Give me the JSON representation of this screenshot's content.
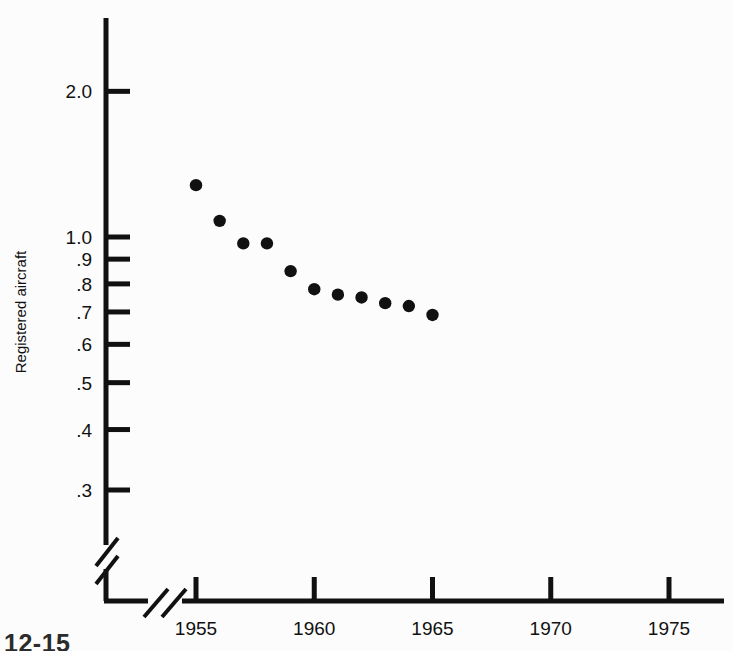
{
  "figure": {
    "caption_fragment": "12-15",
    "background_color": "#fcfcfc",
    "ink_color": "#111111"
  },
  "chart_data": {
    "type": "scatter",
    "title": "",
    "subtitle": "",
    "xlabel": "",
    "ylabel": "Registered aircraft",
    "x": [
      1955,
      1956,
      1957,
      1958,
      1959,
      1960,
      1961,
      1962,
      1963,
      1964,
      1965
    ],
    "values": [
      1.28,
      1.08,
      0.97,
      0.97,
      0.85,
      0.78,
      0.76,
      0.75,
      0.73,
      0.72,
      0.69
    ],
    "series": [
      {
        "name": "Registered aircraft",
        "values": [
          1.28,
          1.08,
          0.97,
          0.97,
          0.85,
          0.78,
          0.76,
          0.75,
          0.73,
          0.72,
          0.69
        ]
      }
    ],
    "xlim": [
      1953,
      1977
    ],
    "ylim": [
      0.28,
      2.3
    ],
    "yscale": "log",
    "xscale": "linear",
    "grid": false,
    "legend": false,
    "legend_position": "none",
    "marker": "filled-circle",
    "marker_color": "#111111",
    "x_ticks": [
      1955,
      1960,
      1965,
      1970,
      1975
    ],
    "x_tick_labels": [
      "1955",
      "1960",
      "1965",
      "1970",
      "1975"
    ],
    "y_ticks": [
      0.3,
      0.4,
      0.5,
      0.6,
      0.7,
      0.8,
      0.9,
      1.0,
      2.0
    ],
    "y_tick_labels": [
      ".3",
      ".4",
      ".5",
      ".6",
      ".7",
      ".8",
      ".9",
      "1.0",
      "2.0"
    ],
    "axis_breaks": {
      "y_break": true,
      "x_break": true
    }
  }
}
